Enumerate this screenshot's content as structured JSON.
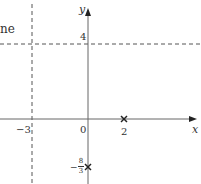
{
  "fragment_text": "ne",
  "axes": {
    "x_label": "x",
    "y_label": "y",
    "origin_label": "0"
  },
  "asymptotes": {
    "vertical": {
      "x": -3,
      "label": "−3"
    },
    "horizontal": {
      "y": 4,
      "label": "4"
    }
  },
  "points": [
    {
      "x": 2,
      "y": 0,
      "label": "2",
      "marker": "cross"
    },
    {
      "x": 0,
      "y": "-8/3",
      "label_sign": "−",
      "label_num": "8",
      "label_den": "3",
      "marker": "cross"
    }
  ],
  "colors": {
    "axis": "#555555",
    "dashed": "#555555",
    "text": "#333333"
  }
}
